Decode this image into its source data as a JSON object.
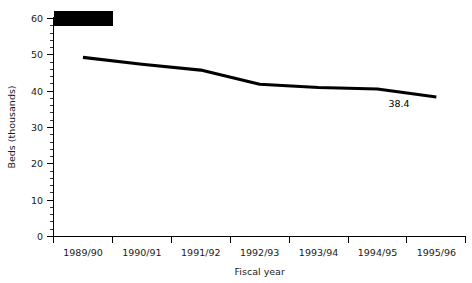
{
  "chart_data": {
    "type": "line",
    "title": "",
    "subtitle": "",
    "xlabel": "Fiscal year",
    "ylabel": "Beds (thousands)",
    "categories": [
      "1989/90",
      "1990/91",
      "1991/92",
      "1992/93",
      "1993/94",
      "1994/95",
      "1995/96"
    ],
    "series": [
      {
        "name": "Beds",
        "values": [
          49.3,
          47.4,
          45.8,
          41.9,
          41.0,
          40.6,
          38.4
        ]
      }
    ],
    "ylim": [
      0,
      60
    ],
    "yticks": [
      0,
      10,
      20,
      30,
      40,
      50,
      60
    ],
    "ytick_labels": [
      "0",
      "10",
      "20",
      "30",
      "40",
      "50",
      "60"
    ],
    "yminor_step": 2,
    "grid": false,
    "legend": "none",
    "annotations": [
      {
        "name": "last-point-value",
        "text": "38.4",
        "category": "1995/96",
        "value": 38.4
      }
    ],
    "line_color": "#000000",
    "axis_color": "#000000",
    "background_color": "#ffffff"
  },
  "overlay": {
    "redaction": {
      "label": "redacted-title-block",
      "color": "#000000"
    }
  }
}
